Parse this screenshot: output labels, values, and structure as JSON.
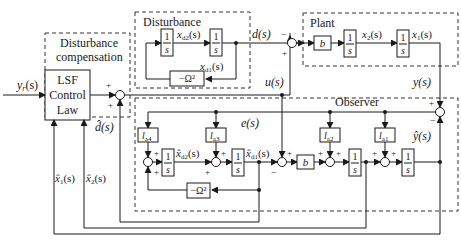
{
  "diagram": {
    "groups": {
      "disturbance": "Disturbance",
      "plant": "Plant",
      "observer": "Observer",
      "compensation_line1": "Disturbance",
      "compensation_line2": "compensation"
    },
    "controller": {
      "line1": "LSF",
      "line2": "Control",
      "line3": "Law"
    },
    "blocks": {
      "integrator_num": "1",
      "integrator_den": "s",
      "gain_b": "b",
      "omega": "−Ω²",
      "la1": "l",
      "la1_sub": "a1",
      "la2": "l",
      "la2_sub": "a2",
      "la3": "l",
      "la3_sub": "a3",
      "la4": "l",
      "la4_sub": "a4"
    },
    "signals": {
      "yr": "y",
      "yr_sub": "r",
      "yr_arg": "(s)",
      "d": "d(s)",
      "u": "u(s)",
      "y": "y(s)",
      "e": "e(s)",
      "x1": "x",
      "x1_sub": "1",
      "x2": "x",
      "x2_sub": "2",
      "xd1": "x",
      "xd1_sub": "d1",
      "xd2": "x",
      "xd2_sub": "d2",
      "arg": "(s)",
      "dhat": "d̂(s)",
      "yhat": "ŷ(s)",
      "xhat1": "x̂",
      "xhat2": "x̂",
      "xhatd1": "x̂",
      "xhatd2": "x̂"
    },
    "signs": {
      "plus": "+",
      "minus": "−"
    }
  }
}
